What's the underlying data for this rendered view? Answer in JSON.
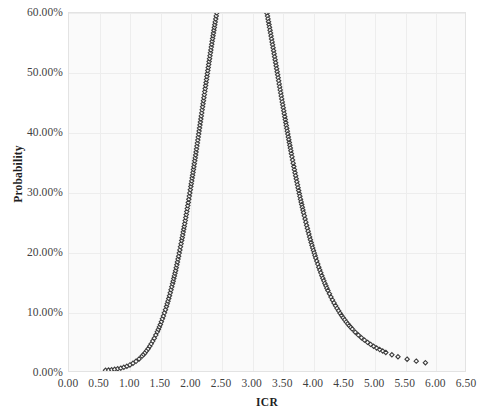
{
  "chart_data": {
    "type": "scatter",
    "title": "",
    "subtitle": "",
    "xlabel": "ICR",
    "ylabel": "Probability",
    "xlim": [
      0.0,
      6.5
    ],
    "ylim": [
      0.0,
      0.6
    ],
    "xtick_labels": [
      "0.00",
      "0.50",
      "1.00",
      "1.50",
      "2.00",
      "2.50",
      "3.00",
      "3.50",
      "4.00",
      "4.50",
      "5.00",
      "5.50",
      "6.00",
      "6.50"
    ],
    "xtick_values": [
      0.0,
      0.5,
      1.0,
      1.5,
      2.0,
      2.5,
      3.0,
      3.5,
      4.0,
      4.5,
      5.0,
      5.5,
      6.0,
      6.5
    ],
    "ytick_labels": [
      "0.00%",
      "10.00%",
      "20.00%",
      "30.00%",
      "40.00%",
      "50.00%",
      "60.00%"
    ],
    "ytick_values": [
      0.0,
      0.1,
      0.2,
      0.3,
      0.4,
      0.5,
      0.6
    ],
    "grid": true,
    "legend": null,
    "marker": {
      "shape": "diamond-outline",
      "size_px": 4.4,
      "edge_color": "#3c3c3c",
      "fill_color": "#ffffff",
      "edge_width_px": 1.1
    },
    "distribution": {
      "family": "normal",
      "mean": 2.95,
      "sigma": 0.78,
      "peak_probability": 0.507,
      "peak_x": 2.95
    },
    "series": [
      {
        "name": "Probability",
        "points": [
          [
            0.6,
            0.0012
          ],
          [
            0.65,
            0.0016
          ],
          [
            0.7,
            0.0021
          ],
          [
            0.75,
            0.0028
          ],
          [
            0.8,
            0.0037
          ],
          [
            0.85,
            0.0048
          ],
          [
            0.9,
            0.0062
          ],
          [
            0.95,
            0.008
          ],
          [
            1.0,
            0.0102
          ],
          [
            1.05,
            0.0129
          ],
          [
            1.1,
            0.0162
          ],
          [
            1.15,
            0.0202
          ],
          [
            1.2,
            0.025
          ],
          [
            1.25,
            0.0307
          ],
          [
            1.3,
            0.0375
          ],
          [
            1.35,
            0.0455
          ],
          [
            1.4,
            0.0548
          ],
          [
            1.45,
            0.0656
          ],
          [
            1.5,
            0.078
          ],
          [
            1.55,
            0.0921
          ],
          [
            1.6,
            0.1081
          ],
          [
            1.65,
            0.1261
          ],
          [
            1.7,
            0.1461
          ],
          [
            1.75,
            0.1682
          ],
          [
            1.8,
            0.1924
          ],
          [
            1.85,
            0.2187
          ],
          [
            1.9,
            0.247
          ],
          [
            1.95,
            0.2772
          ],
          [
            2.0,
            0.3091
          ],
          [
            2.05,
            0.3424
          ],
          [
            2.1,
            0.3769
          ],
          [
            2.15,
            0.4122
          ],
          [
            2.2,
            0.4479
          ],
          [
            2.25,
            0.4835
          ],
          [
            2.3,
            0.5186
          ],
          [
            2.35,
            0.5526
          ],
          [
            2.4,
            0.585
          ],
          [
            2.45,
            0.6153
          ],
          [
            2.5,
            0.643
          ],
          [
            2.55,
            0.6676
          ],
          [
            2.6,
            0.6888
          ],
          [
            2.65,
            0.7062
          ],
          [
            2.7,
            0.7195
          ],
          [
            2.75,
            0.7286
          ],
          [
            2.8,
            0.7333
          ],
          [
            2.85,
            0.7336
          ],
          [
            2.9,
            0.7295
          ],
          [
            2.95,
            0.7212
          ],
          [
            3.0,
            0.7089
          ],
          [
            3.05,
            0.6929
          ],
          [
            3.1,
            0.6735
          ],
          [
            3.15,
            0.6512
          ],
          [
            3.2,
            0.6264
          ],
          [
            3.25,
            0.5996
          ],
          [
            3.3,
            0.5712
          ],
          [
            3.35,
            0.5417
          ],
          [
            3.4,
            0.5116
          ],
          [
            3.45,
            0.4812
          ],
          [
            3.5,
            0.451
          ],
          [
            3.55,
            0.4213
          ],
          [
            3.6,
            0.3923
          ],
          [
            3.65,
            0.3643
          ],
          [
            3.7,
            0.3375
          ],
          [
            3.75,
            0.312
          ],
          [
            3.8,
            0.2879
          ],
          [
            3.85,
            0.2653
          ],
          [
            3.9,
            0.2442
          ],
          [
            3.95,
            0.2245
          ],
          [
            4.0,
            0.2063
          ],
          [
            4.05,
            0.1895
          ],
          [
            4.1,
            0.174
          ],
          [
            4.15,
            0.1598
          ],
          [
            4.2,
            0.1468
          ],
          [
            4.25,
            0.1349
          ],
          [
            4.3,
            0.124
          ],
          [
            4.35,
            0.1141
          ],
          [
            4.4,
            0.105
          ],
          [
            4.45,
            0.0968
          ],
          [
            4.5,
            0.0892
          ],
          [
            4.55,
            0.0823
          ],
          [
            4.6,
            0.076
          ],
          [
            4.65,
            0.0703
          ],
          [
            4.7,
            0.065
          ],
          [
            4.75,
            0.0602
          ],
          [
            4.8,
            0.0558
          ],
          [
            4.85,
            0.0517
          ],
          [
            4.9,
            0.048
          ],
          [
            4.95,
            0.0446
          ],
          [
            5.0,
            0.0414
          ],
          [
            5.05,
            0.0385
          ],
          [
            5.1,
            0.0359
          ],
          [
            5.15,
            0.0334
          ],
          [
            5.2,
            0.0311
          ],
          [
            5.3,
            0.0272
          ],
          [
            5.4,
            0.0239
          ],
          [
            5.55,
            0.0198
          ],
          [
            5.7,
            0.0165
          ],
          [
            5.85,
            0.0139
          ]
        ]
      }
    ]
  },
  "axes": {
    "y_title": "Probability",
    "x_title": "ICR"
  },
  "colors": {
    "marker_edge": "#3c3c3c",
    "marker_fill": "#ffffff",
    "plot_background": "#fafafa",
    "gridline": "#ededed",
    "frame": "#e3e3e3",
    "tick_text": "#3f3f3f",
    "axis_title_text": "#1f1f1f"
  }
}
